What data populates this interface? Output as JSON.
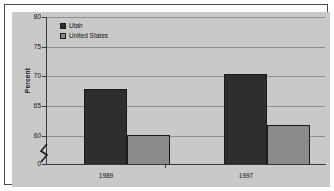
{
  "chart_data": {
    "type": "bar",
    "title": "",
    "xlabel": "",
    "ylabel": "Percent",
    "categories": [
      "1989",
      "1997"
    ],
    "series": [
      {
        "name": "Utah",
        "values": [
          70.3,
          72.3
        ],
        "color": "#2e2e2e"
      },
      {
        "name": "United States",
        "values": [
          64.0,
          65.4
        ],
        "color": "#8a8a8a"
      }
    ],
    "ylim": [
      60,
      80
    ],
    "y_break_value": 0,
    "yticks": [
      "80",
      "75",
      "70",
      "65",
      "60",
      "0"
    ],
    "grid": true,
    "legend_position": "top-left",
    "axis_break": true
  },
  "legend": {
    "items": [
      {
        "label": "Utah"
      },
      {
        "label": "United States"
      }
    ]
  },
  "axis": {
    "y_title": "Percent",
    "y_ticks": [
      {
        "label": "80"
      },
      {
        "label": "75"
      },
      {
        "label": "70"
      },
      {
        "label": "65"
      },
      {
        "label": "60"
      },
      {
        "label": "0"
      }
    ],
    "x_ticks": [
      {
        "label": "1989"
      },
      {
        "label": "1997"
      }
    ]
  }
}
